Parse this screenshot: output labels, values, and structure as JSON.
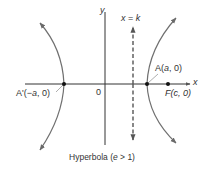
{
  "diagram": {
    "title": "Hyperbola (e > 1)",
    "caption_main": "Hyperbola (",
    "caption_e": "e",
    "caption_rest": " > 1)",
    "axes": {
      "x_label": "x",
      "y_label": "y",
      "origin_label": "0"
    },
    "directrix": {
      "label_x": "x",
      "label_eq": " = ",
      "label_k": "k"
    },
    "points": {
      "vertex_right": {
        "name": "A",
        "coords": "(a, 0)",
        "open": "(",
        "var": "a",
        "close": ", 0)"
      },
      "vertex_left": {
        "name": "A'",
        "open": "(−",
        "var": "a",
        "close": ", 0)"
      },
      "focus": {
        "name": "F",
        "open": "(",
        "var": "c",
        "close": ", 0)"
      }
    },
    "colors": {
      "axis": "#333333",
      "curve": "#707070",
      "point": "#111111",
      "text": "#333333"
    }
  }
}
